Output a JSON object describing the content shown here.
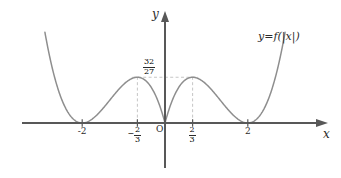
{
  "figure": {
    "curve_equation": "y=f(|x|)",
    "axis_labels": {
      "x": "x",
      "y": "y"
    },
    "origin_label": "O"
  },
  "ticks": {
    "x": [
      {
        "label": "-2",
        "value": -2
      },
      {
        "label": "-2/3",
        "sign": "−",
        "numerator": "2",
        "denominator": "3",
        "value": -0.6667
      },
      {
        "label": "2/3",
        "sign": "",
        "numerator": "2",
        "denominator": "3",
        "value": 0.6667
      },
      {
        "label": "2",
        "value": 2
      }
    ],
    "y": [
      {
        "label": "32/27",
        "numerator": "32",
        "denominator": "27",
        "value": 1.1852
      }
    ]
  },
  "colors": {
    "curve": "#8c8c8c",
    "axis": "#5a5a5a",
    "guide": "#b8b8b8",
    "text": "#2b2b2b",
    "background": "#ffffff"
  },
  "chart_data": {
    "type": "line",
    "title": "",
    "xlabel": "x",
    "ylabel": "y",
    "xlim": [
      -2.9,
      2.9
    ],
    "ylim": [
      -0.35,
      3.6
    ],
    "grid": false,
    "legend": null,
    "annotations": [
      {
        "text": "y=f(|x|)",
        "x": 2.25,
        "y": 3.05
      },
      {
        "text": "O",
        "x": -0.12,
        "y": -0.2
      }
    ],
    "xticks": [
      -2,
      -0.6667,
      0.6667,
      2
    ],
    "xticklabels": [
      "-2",
      "-2/3",
      "2/3",
      "2"
    ],
    "yticks": [
      1.1852
    ],
    "yticklabels": [
      "32/27"
    ],
    "series": [
      {
        "name": "y=f(|x|)",
        "formula": "|x|(|x|-2)^2",
        "x": [
          -2.85,
          -2.7,
          -2.55,
          -2.4,
          -2.25,
          -2.1,
          -2.0,
          -1.9,
          -1.8,
          -1.65,
          -1.5,
          -1.35,
          -1.2,
          -1.05,
          -0.9,
          -0.75,
          -0.6667,
          -0.55,
          -0.4,
          -0.25,
          -0.1,
          0,
          0.1,
          0.25,
          0.4,
          0.55,
          0.6667,
          0.75,
          0.9,
          1.05,
          1.2,
          1.35,
          1.5,
          1.65,
          1.8,
          1.9,
          2.0,
          2.1,
          2.25,
          2.4,
          2.55,
          2.7,
          2.85
        ],
        "y": [
          2.05,
          1.33,
          0.77,
          0.38,
          0.14,
          0.02,
          0.0,
          0.01,
          0.06,
          0.2,
          0.37,
          0.58,
          0.77,
          0.94,
          1.09,
          1.17,
          1.185,
          1.18,
          1.02,
          0.77,
          0.36,
          0.0,
          0.36,
          0.77,
          1.02,
          1.18,
          1.185,
          1.17,
          1.09,
          0.94,
          0.77,
          0.58,
          0.37,
          0.2,
          0.06,
          0.01,
          0.0,
          0.02,
          0.14,
          0.38,
          0.77,
          1.33,
          2.05
        ]
      }
    ],
    "guides": [
      {
        "type": "vertical-dashed",
        "x": -0.6667,
        "from_y": 0,
        "to_y": 1.1852
      },
      {
        "type": "vertical-dashed",
        "x": 0.6667,
        "from_y": 0,
        "to_y": 1.1852
      },
      {
        "type": "horizontal-dashed",
        "y": 1.1852,
        "from_x": -0.6667,
        "to_x": 0.6667
      }
    ]
  }
}
